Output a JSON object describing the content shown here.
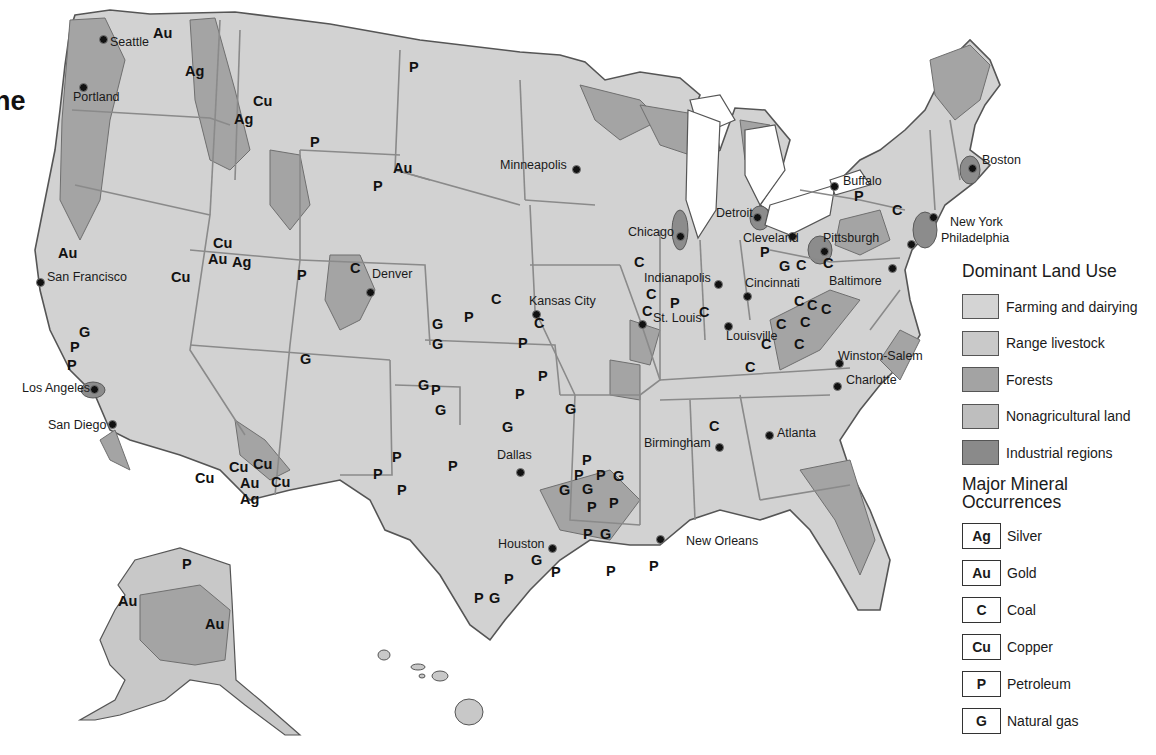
{
  "title_fragment": "ne",
  "colors": {
    "farming": "#d4d4d4",
    "range": "#c9c9c9",
    "forest": "#a3a3a3",
    "nonag": "#bebebe",
    "industrial": "#8a8a8a",
    "border": "#777777",
    "water": "#ffffff"
  },
  "legend": {
    "land_use_title": "Dominant Land Use",
    "land_use": [
      {
        "key": "farming",
        "label": "Farming and dairying",
        "color": "#d4d4d4"
      },
      {
        "key": "range",
        "label": "Range livestock",
        "color": "#c9c9c9"
      },
      {
        "key": "forest",
        "label": "Forests",
        "color": "#a3a3a3"
      },
      {
        "key": "nonag",
        "label": "Nonagricultural land",
        "color": "#bebebe"
      },
      {
        "key": "industrial",
        "label": "Industrial regions",
        "color": "#8a8a8a"
      }
    ],
    "minerals_title_line1": "Major Mineral",
    "minerals_title_line2": "Occurrences",
    "minerals": [
      {
        "symbol": "Ag",
        "label": "Silver"
      },
      {
        "symbol": "Au",
        "label": "Gold"
      },
      {
        "symbol": "C",
        "label": "Coal"
      },
      {
        "symbol": "Cu",
        "label": "Copper"
      },
      {
        "symbol": "P",
        "label": "Petroleum"
      },
      {
        "symbol": "G",
        "label": "Natural gas"
      }
    ]
  },
  "cities": [
    {
      "name": "Seattle",
      "dot": [
        104,
        40
      ],
      "label": [
        110,
        42
      ]
    },
    {
      "name": "Portland",
      "dot": [
        84,
        88
      ],
      "label": [
        73,
        97
      ]
    },
    {
      "name": "San Francisco",
      "dot": [
        41,
        283
      ],
      "label": [
        47,
        277
      ]
    },
    {
      "name": "Los Angeles",
      "dot": [
        95,
        390
      ],
      "label": [
        22,
        388
      ]
    },
    {
      "name": "San Diego",
      "dot": [
        113,
        425
      ],
      "label": [
        48,
        425
      ]
    },
    {
      "name": "Denver",
      "dot": [
        371,
        293
      ],
      "label": [
        372,
        274
      ]
    },
    {
      "name": "Minneapolis",
      "dot": [
        577,
        170
      ],
      "label": [
        500,
        165
      ]
    },
    {
      "name": "Chicago",
      "dot": [
        681,
        237
      ],
      "label": [
        628,
        232
      ]
    },
    {
      "name": "Detroit",
      "dot": [
        758,
        218
      ],
      "label": [
        716,
        213
      ]
    },
    {
      "name": "Cleveland",
      "dot": [
        793,
        237
      ],
      "label": [
        743,
        238
      ]
    },
    {
      "name": "Buffalo",
      "dot": [
        835,
        187
      ],
      "label": [
        843,
        181
      ]
    },
    {
      "name": "Boston",
      "dot": [
        973,
        169
      ],
      "label": [
        982,
        160
      ]
    },
    {
      "name": "New York",
      "dot": [
        934,
        218
      ],
      "label": [
        950,
        222
      ]
    },
    {
      "name": "Philadelphia",
      "dot": [
        912,
        245
      ],
      "label": [
        941,
        238
      ]
    },
    {
      "name": "Pittsburgh",
      "dot": [
        825,
        252
      ],
      "label": [
        823,
        238
      ]
    },
    {
      "name": "Baltimore",
      "dot": [
        893,
        269
      ],
      "label": [
        829,
        281
      ]
    },
    {
      "name": "Indianapolis",
      "dot": [
        719,
        285
      ],
      "label": [
        644,
        278
      ]
    },
    {
      "name": "Cincinnati",
      "dot": [
        748,
        297
      ],
      "label": [
        745,
        283
      ]
    },
    {
      "name": "Kansas City",
      "dot": [
        537,
        315
      ],
      "label": [
        529,
        301
      ]
    },
    {
      "name": "St. Louis",
      "dot": [
        643,
        325
      ],
      "label": [
        653,
        318
      ]
    },
    {
      "name": "Louisville",
      "dot": [
        729,
        327
      ],
      "label": [
        726,
        336
      ]
    },
    {
      "name": "Winston-Salem",
      "dot": [
        840,
        364
      ],
      "label": [
        838,
        356
      ]
    },
    {
      "name": "Charlotte",
      "dot": [
        838,
        387
      ],
      "label": [
        846,
        380
      ]
    },
    {
      "name": "Atlanta",
      "dot": [
        770,
        436
      ],
      "label": [
        777,
        433
      ]
    },
    {
      "name": "Birmingham",
      "dot": [
        720,
        448
      ],
      "label": [
        644,
        443
      ]
    },
    {
      "name": "Dallas",
      "dot": [
        521,
        473
      ],
      "label": [
        497,
        455
      ]
    },
    {
      "name": "Houston",
      "dot": [
        553,
        549
      ],
      "label": [
        498,
        544
      ]
    },
    {
      "name": "New Orleans",
      "dot": [
        661,
        540
      ],
      "label": [
        686,
        541
      ]
    }
  ],
  "mineral_sites": [
    {
      "s": "Au",
      "x": 159,
      "y": 34
    },
    {
      "s": "Ag",
      "x": 191,
      "y": 72
    },
    {
      "s": "Cu",
      "x": 259,
      "y": 102
    },
    {
      "s": "Ag",
      "x": 240,
      "y": 120
    },
    {
      "s": "P",
      "x": 415,
      "y": 68
    },
    {
      "s": "P",
      "x": 316,
      "y": 143
    },
    {
      "s": "Au",
      "x": 399,
      "y": 169
    },
    {
      "s": "P",
      "x": 379,
      "y": 187
    },
    {
      "s": "Cu",
      "x": 219,
      "y": 244
    },
    {
      "s": "Au",
      "x": 214,
      "y": 260
    },
    {
      "s": "Ag",
      "x": 238,
      "y": 263
    },
    {
      "s": "Au",
      "x": 64,
      "y": 254
    },
    {
      "s": "Cu",
      "x": 177,
      "y": 278
    },
    {
      "s": "C",
      "x": 356,
      "y": 269
    },
    {
      "s": "P",
      "x": 303,
      "y": 276
    },
    {
      "s": "G",
      "x": 85,
      "y": 333
    },
    {
      "s": "P",
      "x": 76,
      "y": 348
    },
    {
      "s": "P",
      "x": 73,
      "y": 366
    },
    {
      "s": "G",
      "x": 306,
      "y": 360
    },
    {
      "s": "G",
      "x": 438,
      "y": 325
    },
    {
      "s": "G",
      "x": 438,
      "y": 345
    },
    {
      "s": "P",
      "x": 470,
      "y": 318
    },
    {
      "s": "C",
      "x": 497,
      "y": 300
    },
    {
      "s": "C",
      "x": 540,
      "y": 324
    },
    {
      "s": "P",
      "x": 524,
      "y": 344
    },
    {
      "s": "G",
      "x": 424,
      "y": 386
    },
    {
      "s": "P",
      "x": 437,
      "y": 391
    },
    {
      "s": "G",
      "x": 441,
      "y": 411
    },
    {
      "s": "P",
      "x": 544,
      "y": 377
    },
    {
      "s": "P",
      "x": 521,
      "y": 395
    },
    {
      "s": "G",
      "x": 571,
      "y": 410
    },
    {
      "s": "G",
      "x": 508,
      "y": 428
    },
    {
      "s": "C",
      "x": 640,
      "y": 263
    },
    {
      "s": "C",
      "x": 652,
      "y": 295
    },
    {
      "s": "P",
      "x": 676,
      "y": 304
    },
    {
      "s": "C",
      "x": 705,
      "y": 313
    },
    {
      "s": "C",
      "x": 648,
      "y": 312
    },
    {
      "s": "P",
      "x": 766,
      "y": 253
    },
    {
      "s": "G",
      "x": 785,
      "y": 267
    },
    {
      "s": "C",
      "x": 802,
      "y": 266
    },
    {
      "s": "C",
      "x": 829,
      "y": 264
    },
    {
      "s": "P",
      "x": 860,
      "y": 197
    },
    {
      "s": "C",
      "x": 898,
      "y": 211
    },
    {
      "s": "C",
      "x": 800,
      "y": 302
    },
    {
      "s": "C",
      "x": 813,
      "y": 306
    },
    {
      "s": "C",
      "x": 827,
      "y": 310
    },
    {
      "s": "C",
      "x": 782,
      "y": 325
    },
    {
      "s": "C",
      "x": 806,
      "y": 323
    },
    {
      "s": "C",
      "x": 767,
      "y": 345
    },
    {
      "s": "C",
      "x": 800,
      "y": 345
    },
    {
      "s": "C",
      "x": 751,
      "y": 368
    },
    {
      "s": "C",
      "x": 715,
      "y": 427
    },
    {
      "s": "Cu",
      "x": 201,
      "y": 479
    },
    {
      "s": "Cu",
      "x": 235,
      "y": 468
    },
    {
      "s": "Cu",
      "x": 259,
      "y": 465
    },
    {
      "s": "Au",
      "x": 246,
      "y": 484
    },
    {
      "s": "Ag",
      "x": 246,
      "y": 500
    },
    {
      "s": "Cu",
      "x": 277,
      "y": 483
    },
    {
      "s": "P",
      "x": 398,
      "y": 458
    },
    {
      "s": "P",
      "x": 379,
      "y": 475
    },
    {
      "s": "P",
      "x": 403,
      "y": 491
    },
    {
      "s": "P",
      "x": 454,
      "y": 467
    },
    {
      "s": "P",
      "x": 588,
      "y": 461
    },
    {
      "s": "P",
      "x": 580,
      "y": 476
    },
    {
      "s": "P",
      "x": 602,
      "y": 476
    },
    {
      "s": "G",
      "x": 619,
      "y": 477
    },
    {
      "s": "G",
      "x": 565,
      "y": 491
    },
    {
      "s": "G",
      "x": 588,
      "y": 490
    },
    {
      "s": "P",
      "x": 593,
      "y": 508
    },
    {
      "s": "P",
      "x": 615,
      "y": 504
    },
    {
      "s": "P",
      "x": 589,
      "y": 535
    },
    {
      "s": "G",
      "x": 606,
      "y": 535
    },
    {
      "s": "G",
      "x": 537,
      "y": 561
    },
    {
      "s": "P",
      "x": 557,
      "y": 573
    },
    {
      "s": "P",
      "x": 612,
      "y": 572
    },
    {
      "s": "P",
      "x": 655,
      "y": 567
    },
    {
      "s": "P",
      "x": 510,
      "y": 580
    },
    {
      "s": "P",
      "x": 480,
      "y": 599
    },
    {
      "s": "G",
      "x": 495,
      "y": 599
    },
    {
      "s": "P",
      "x": 188,
      "y": 565
    },
    {
      "s": "Au",
      "x": 124,
      "y": 602
    },
    {
      "s": "Au",
      "x": 211,
      "y": 625
    }
  ]
}
